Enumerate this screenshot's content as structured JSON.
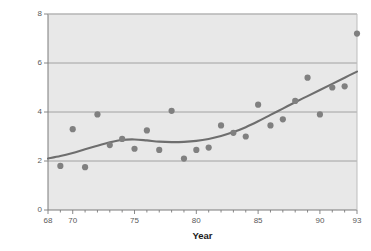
{
  "chart_data": {
    "type": "scatter",
    "title": "",
    "xlabel": "Year",
    "ylabel": "Mean number of birds",
    "xlim": [
      68,
      93
    ],
    "ylim": [
      0,
      8
    ],
    "grid": true,
    "legend": "none",
    "xticks": [
      68,
      70,
      75,
      80,
      85,
      90,
      93
    ],
    "xtick_labels": [
      "68",
      "70",
      "75",
      "80",
      "85",
      "90",
      "93"
    ],
    "yticks": [
      0,
      2,
      4,
      6,
      8
    ],
    "ytick_labels": [
      "0",
      "2",
      "4",
      "6",
      "8"
    ],
    "x": [
      69,
      70,
      71,
      72,
      73,
      74,
      75,
      76,
      77,
      78,
      79,
      80,
      81,
      82,
      83,
      84,
      85,
      86,
      87,
      88,
      89,
      90,
      91,
      92,
      93
    ],
    "values": [
      1.8,
      3.3,
      1.75,
      3.9,
      2.65,
      2.9,
      2.5,
      3.25,
      2.45,
      4.05,
      2.1,
      2.45,
      2.55,
      3.45,
      3.15,
      3.0,
      4.3,
      3.45,
      3.7,
      4.45,
      5.4,
      3.9,
      5.0,
      5.05,
      7.2
    ],
    "series": [
      {
        "name": "Mean number of birds",
        "type": "scatter",
        "marker_color": "#808080",
        "x": [
          69,
          70,
          71,
          72,
          73,
          74,
          75,
          76,
          77,
          78,
          79,
          80,
          81,
          82,
          83,
          84,
          85,
          86,
          87,
          88,
          89,
          90,
          91,
          92,
          93
        ],
        "values": [
          1.8,
          3.3,
          1.75,
          3.9,
          2.65,
          2.9,
          2.5,
          3.25,
          2.45,
          4.05,
          2.1,
          2.45,
          2.55,
          3.45,
          3.15,
          3.0,
          4.3,
          3.45,
          3.7,
          4.45,
          5.4,
          3.9,
          5.0,
          5.05,
          7.2
        ]
      },
      {
        "name": "Smoothed trend",
        "type": "line",
        "line_color": "#6e6e6e",
        "x": [
          68,
          69,
          70,
          71,
          72,
          73,
          74,
          75,
          76,
          77,
          78,
          79,
          80,
          81,
          82,
          83,
          84,
          85,
          86,
          87,
          88,
          89,
          90,
          91,
          92,
          93
        ],
        "values": [
          2.1,
          2.2,
          2.33,
          2.48,
          2.62,
          2.76,
          2.86,
          2.88,
          2.84,
          2.79,
          2.77,
          2.78,
          2.82,
          2.9,
          3.02,
          3.18,
          3.38,
          3.62,
          3.88,
          4.14,
          4.4,
          4.65,
          4.9,
          5.15,
          5.4,
          5.65
        ]
      }
    ],
    "colors": {
      "plot_background": "#e8e8e8",
      "grid_line": "#9a9a9a",
      "axis_line": "#7a7a7a",
      "marker": "#808080",
      "trend_line": "#6e6e6e",
      "tick_text": "#5a5a5a",
      "title_text": "#1a1a1a",
      "page_background": "#ffffff"
    }
  },
  "axes": {
    "x_title": "Year",
    "y_title": "Mean number of birds"
  }
}
